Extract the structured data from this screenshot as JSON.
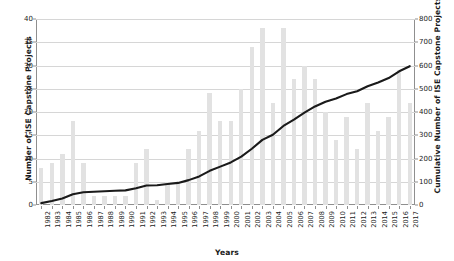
{
  "chart_data": {
    "type": "bar",
    "title": "",
    "subtitle": "",
    "xlabel": "Years",
    "ylabel": "Number of ISE Capstone Projects",
    "ylabel_secondary": "Cumulative Number of ISE Capstone Projects",
    "ylim": [
      0,
      40
    ],
    "ylim_secondary": [
      0,
      800
    ],
    "ytick_step": 5,
    "ytick_step_secondary": 100,
    "yticks": [
      0,
      5,
      10,
      15,
      20,
      25,
      30,
      35,
      40
    ],
    "yticks_secondary": [
      0,
      100,
      200,
      300,
      400,
      500,
      600,
      700,
      800
    ],
    "grid": true,
    "legend": "none",
    "bar_color": "#e2e2e2",
    "line_color": "#1a1a1a",
    "categories": [
      "1982",
      "1983",
      "1984",
      "1985",
      "1986",
      "1987",
      "1988",
      "1989",
      "1990",
      "1991",
      "1992",
      "1993",
      "1994",
      "1995",
      "1996",
      "1997",
      "1998",
      "1999",
      "2000",
      "2001",
      "2002",
      "2003",
      "2004",
      "2005",
      "2006",
      "2007",
      "2008",
      "2009",
      "2010",
      "2011",
      "2012",
      "2013",
      "2014",
      "2015",
      "2016",
      "2017"
    ],
    "series": [
      {
        "name": "Number of ISE Capstone Projects",
        "type": "bar",
        "axis": "left",
        "values": [
          8,
          9,
          11,
          18,
          9,
          2,
          2,
          2,
          2,
          9,
          12,
          1,
          5,
          5,
          12,
          16,
          24,
          18,
          18,
          25,
          34,
          38,
          22,
          38,
          27,
          30,
          27,
          20,
          14,
          19,
          12,
          22,
          16,
          19,
          29,
          22
        ]
      },
      {
        "name": "Cumulative Number of ISE Capstone Projects",
        "type": "line",
        "axis": "right",
        "values": [
          8,
          17,
          28,
          46,
          55,
          57,
          59,
          61,
          63,
          72,
          84,
          85,
          90,
          95,
          107,
          123,
          147,
          165,
          183,
          208,
          242,
          280,
          302,
          340,
          367,
          397,
          424,
          444,
          458,
          477,
          489,
          511,
          527,
          546,
          575,
          597
        ]
      }
    ]
  }
}
